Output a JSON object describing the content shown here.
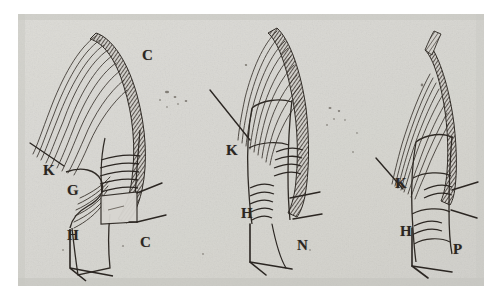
{
  "plate": {
    "title": "Anatomical engraving plate — three dissection figures",
    "description": "Scanned monochrome line engraving showing three successive dissection stages of a hatched curved band with parallel muscle-fibre bundles and a banded cylindrical shaft.",
    "background_color": "#ffffff",
    "paper_color": "#dcdbd7",
    "paper_edge_color": "#c9c8c3",
    "ink_color": "#2b2622",
    "hatch_color": "#4a443e",
    "paper_rect": {
      "x": 18,
      "y": 14,
      "width": 466,
      "height": 272
    },
    "figure_count": 3
  },
  "figures": [
    {
      "name": "figure-left",
      "labels": [
        {
          "text": "C",
          "x": 142,
          "y": 48,
          "name": "label-c-upper"
        },
        {
          "text": "K",
          "x": 43,
          "y": 163,
          "name": "label-k"
        },
        {
          "text": "G",
          "x": 67,
          "y": 183,
          "name": "label-g"
        },
        {
          "text": "H",
          "x": 67,
          "y": 228,
          "name": "label-h"
        },
        {
          "text": "C",
          "x": 140,
          "y": 235,
          "name": "label-c-lower"
        }
      ]
    },
    {
      "name": "figure-middle",
      "labels": [
        {
          "text": "K",
          "x": 226,
          "y": 143,
          "name": "label-k"
        },
        {
          "text": "H",
          "x": 241,
          "y": 206,
          "name": "label-h"
        },
        {
          "text": "N",
          "x": 297,
          "y": 238,
          "name": "label-n"
        }
      ]
    },
    {
      "name": "figure-right",
      "labels": [
        {
          "text": "K",
          "x": 395,
          "y": 176,
          "name": "label-k"
        },
        {
          "text": "H",
          "x": 400,
          "y": 224,
          "name": "label-h"
        },
        {
          "text": "P",
          "x": 453,
          "y": 242,
          "name": "label-p"
        }
      ]
    }
  ]
}
